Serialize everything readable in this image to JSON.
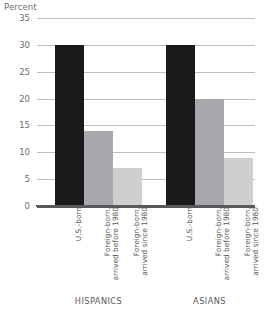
{
  "chart_data": {
    "type": "bar",
    "title": "",
    "xlabel": "",
    "ylabel": "Percent",
    "ylim": [
      0,
      35
    ],
    "yticks": [
      0,
      5,
      10,
      15,
      20,
      25,
      30,
      35
    ],
    "ytick_labels": [
      "0",
      "5",
      "10",
      "15",
      "20",
      "25",
      "30",
      "35"
    ],
    "grid": true,
    "legend": "none",
    "groups": [
      "HISPANICS",
      "ASIANS"
    ],
    "categories": [
      "U.S.-born",
      "Foreign-born,\narrived before 1980",
      "Foreign-born,\narrived since 1980"
    ],
    "series": [
      {
        "name": "HISPANICS",
        "values": [
          30,
          14,
          7
        ]
      },
      {
        "name": "ASIANS",
        "values": [
          30,
          20,
          9
        ]
      }
    ],
    "bars": [
      {
        "group": "HISPANICS",
        "category": "U.S.-born",
        "value": 30,
        "color": "#1a1a1a"
      },
      {
        "group": "HISPANICS",
        "category": "Foreign-born, arrived before 1980",
        "value": 14,
        "color": "#a6a8ab"
      },
      {
        "group": "HISPANICS",
        "category": "Foreign-born, arrived since 1980",
        "value": 7,
        "color": "#cdcfd1"
      },
      {
        "group": "ASIANS",
        "category": "U.S.-born",
        "value": 30,
        "color": "#1a1a1a"
      },
      {
        "group": "ASIANS",
        "category": "Foreign-born, arrived before 1980",
        "value": 20,
        "color": "#a6a8ab"
      },
      {
        "group": "ASIANS",
        "category": "Foreign-born, arrived since 1980",
        "value": 9,
        "color": "#cdcfd1"
      }
    ],
    "colors": {
      "us_born": "#1a1a1a",
      "foreign_before_1980": "#a6a8ab",
      "foreign_since_1980": "#cdcfd1",
      "gridline": "#bcbec0",
      "axis": "#58595b",
      "text": "#58595b",
      "background": "#ffffff"
    }
  },
  "axis": {
    "y_title": "Percent",
    "ticks": [
      "35",
      "30",
      "25",
      "20",
      "15",
      "10",
      "5",
      "0"
    ]
  },
  "x_axis": {
    "labels": [
      "U.S.-born",
      "Foreign-born,\narrived before 1980",
      "Foreign-born,\narrived since 1980",
      "U.S.-born",
      "Foreign-born,\narrived before 1980",
      "Foreign-born,\narrived since 1980"
    ]
  },
  "groups": {
    "labels": [
      "HISPANICS",
      "ASIANS"
    ]
  },
  "footnote": {
    "text": ""
  }
}
